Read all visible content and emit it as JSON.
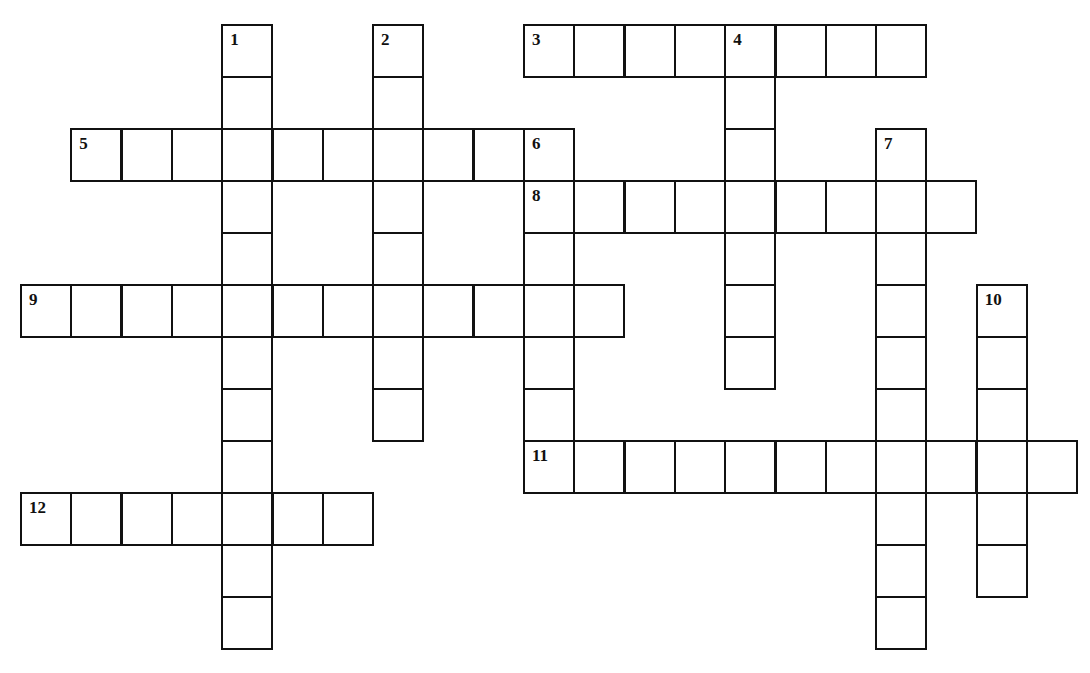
{
  "puzzle": {
    "type": "crossword",
    "grid": {
      "origin_x": 21,
      "origin_y": 25,
      "cell_w": 50.3,
      "cell_h": 52,
      "line_color": "#111111",
      "cell_color": "#ffffff"
    },
    "entries": [
      {
        "number": "1",
        "direction": "down",
        "row": 0,
        "col": 4,
        "length": 12
      },
      {
        "number": "2",
        "direction": "down",
        "row": 0,
        "col": 7,
        "length": 8
      },
      {
        "number": "3",
        "direction": "across",
        "row": 0,
        "col": 10,
        "length": 8
      },
      {
        "number": "4",
        "direction": "down",
        "row": 0,
        "col": 14,
        "length": 7
      },
      {
        "number": "5",
        "direction": "across",
        "row": 2,
        "col": 1,
        "length": 10
      },
      {
        "number": "6",
        "direction": "down",
        "row": 2,
        "col": 10,
        "length": 7
      },
      {
        "number": "7",
        "direction": "down",
        "row": 2,
        "col": 17,
        "length": 10
      },
      {
        "number": "8",
        "direction": "across",
        "row": 3,
        "col": 10,
        "length": 9
      },
      {
        "number": "9",
        "direction": "across",
        "row": 5,
        "col": 0,
        "length": 12
      },
      {
        "number": "10",
        "direction": "down",
        "row": 5,
        "col": 19,
        "length": 6
      },
      {
        "number": "11",
        "direction": "across",
        "row": 8,
        "col": 10,
        "length": 11
      },
      {
        "number": "12",
        "direction": "across",
        "row": 9,
        "col": 0,
        "length": 7
      }
    ]
  }
}
